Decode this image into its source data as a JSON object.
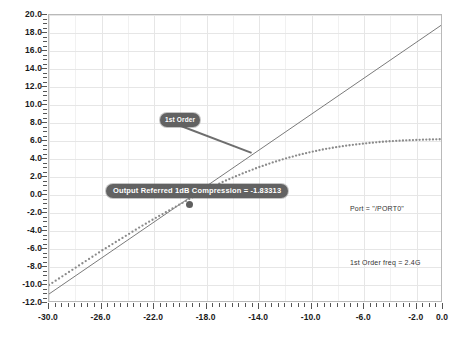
{
  "chart_data": {
    "type": "line",
    "title": "",
    "xlabel": "",
    "ylabel": "",
    "xlim": [
      -30.0,
      0.0
    ],
    "ylim": [
      -12.0,
      20.0
    ],
    "grid": true,
    "legend_position": "none",
    "xticks": [
      "-30.0",
      "-26.0",
      "-22.0",
      "-18.0",
      "-14.0",
      "-10.0",
      "-6.0",
      "-2.0",
      "0.0"
    ],
    "xtick_values": [
      -30.0,
      -26.0,
      -22.0,
      -18.0,
      -14.0,
      -10.0,
      -6.0,
      -2.0,
      0.0
    ],
    "yticks": [
      "20.0",
      "18.0",
      "16.0",
      "14.0",
      "12.0",
      "10.0",
      "8.0",
      "6.0",
      "4.0",
      "2.0",
      "0.0",
      "-2.0",
      "-4.0",
      "-6.0",
      "-8.0",
      "-10.0",
      "-12.0"
    ],
    "ytick_values": [
      20.0,
      18.0,
      16.0,
      14.0,
      12.0,
      10.0,
      8.0,
      6.0,
      4.0,
      2.0,
      0.0,
      -2.0,
      -4.0,
      -6.0,
      -8.0,
      -10.0,
      -12.0
    ],
    "series": [
      {
        "name": "1st Order",
        "style": "solid",
        "color": "#7a7a7a",
        "x": [
          -30.0,
          0.0
        ],
        "values": [
          -11.0,
          19.0
        ]
      },
      {
        "name": "Output Referred 1dB Compression",
        "style": "dotted",
        "color": "#8a8a8a",
        "x": [
          -30.0,
          -29.0,
          -28.0,
          -27.0,
          -26.0,
          -25.0,
          -24.0,
          -23.0,
          -22.0,
          -21.0,
          -20.0,
          -19.0,
          -18.0,
          -17.0,
          -16.0,
          -15.0,
          -14.0,
          -13.0,
          -12.0,
          -11.0,
          -10.0,
          -9.0,
          -8.0,
          -7.0,
          -6.0,
          -5.0,
          -4.0,
          -3.0,
          -2.0,
          -1.0,
          0.0
        ],
        "values": [
          -10.0,
          -9.05,
          -8.1,
          -7.15,
          -6.2,
          -5.3,
          -4.4,
          -3.5,
          -2.65,
          -1.83,
          -1.0,
          -0.2,
          0.55,
          1.3,
          1.95,
          2.55,
          3.1,
          3.6,
          4.05,
          4.45,
          4.8,
          5.1,
          5.35,
          5.55,
          5.72,
          5.87,
          5.98,
          6.06,
          6.12,
          6.17,
          6.2
        ]
      }
    ],
    "annotations": [
      {
        "id": "order-label",
        "text": "1st Order",
        "kind": "callout",
        "points_to_x": -14.6,
        "points_to_y": 4.8
      },
      {
        "id": "p1db-label",
        "text": "Output Referred 1dB Compression = -1.83313",
        "kind": "callout",
        "value": -1.83313,
        "marker_x": -19.3,
        "marker_y": -1.1
      },
      {
        "id": "port-note",
        "text": "Port = \"/PORT0\"",
        "kind": "text"
      },
      {
        "id": "freq-note",
        "text": "1st Order freq = 2.4G",
        "kind": "text"
      }
    ]
  },
  "notes": {
    "port": "Port = \"/PORT0\"",
    "freq": "1st Order freq = 2.4G"
  },
  "callouts": {
    "order": "1st Order",
    "p1db": "Output Referred 1dB Compression = -1.83313"
  }
}
